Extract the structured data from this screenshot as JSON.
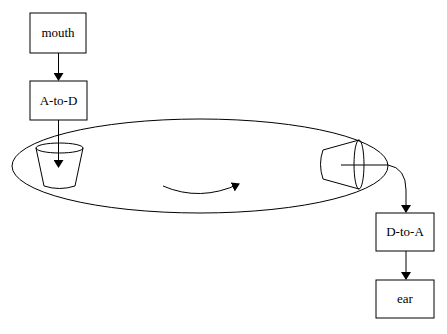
{
  "diagram": {
    "nodes": [
      {
        "id": "mouth",
        "label": "mouth"
      },
      {
        "id": "a-to-d",
        "label": "A-to-D"
      },
      {
        "id": "d-to-a",
        "label": "D-to-A"
      },
      {
        "id": "ear",
        "label": "ear"
      }
    ],
    "edges": [
      {
        "from": "mouth",
        "to": "a-to-d"
      },
      {
        "from": "a-to-d",
        "to": "input-cup"
      },
      {
        "from": "output-cup",
        "to": "d-to-a"
      },
      {
        "from": "d-to-a",
        "to": "ear"
      }
    ],
    "shapes": {
      "channel": "ellipse",
      "input_cup": "cup",
      "output_cup": "cup-sideways",
      "flow": "curved-arrow"
    },
    "colors": {
      "stroke": "#000000",
      "background": "#ffffff"
    }
  }
}
